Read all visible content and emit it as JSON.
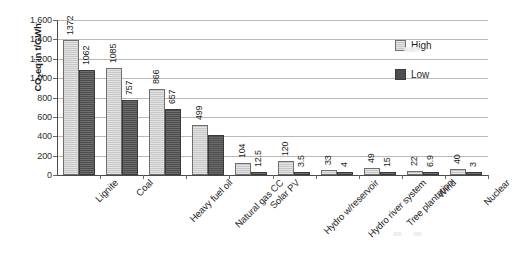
{
  "chart_data": {
    "type": "bar",
    "title": "",
    "xlabel": "",
    "ylabel": "CO2eq in t/GWh",
    "ylabel_parts": {
      "pre": "CO",
      "sub": "2",
      "post": "eq in t/GWh"
    },
    "ylim": [
      0,
      1600
    ],
    "ytick_step": 200,
    "ytick_labels": [
      "1,600",
      "1,400",
      "1,200",
      "1,000",
      "800",
      "600",
      "400",
      "200",
      "0"
    ],
    "ytick_values": [
      1600,
      1400,
      1200,
      1000,
      800,
      600,
      400,
      200,
      0
    ],
    "grid": true,
    "legend_position": "inside-top-right",
    "categories": [
      "Lignite",
      "Coal",
      "Heavy fuel oil",
      "Natural gas CC",
      "Solar PV",
      "Hydro w/reservoir",
      "Hydro river system",
      "Tree plantation",
      "Wind",
      "Nuclear"
    ],
    "series": [
      {
        "name": "High",
        "color": "#c6c6c6",
        "values": [
          1372,
          1085,
          866,
          499,
          104,
          120,
          33,
          49,
          22,
          40
        ],
        "labels": [
          "1372",
          "1085",
          "866",
          "499",
          "104",
          "120",
          "33",
          "49",
          "22",
          "40"
        ]
      },
      {
        "name": "Low",
        "color": "#4d4d4d",
        "values": [
          1062,
          757,
          657,
          390,
          12.5,
          3.5,
          4,
          15,
          6.9,
          3
        ],
        "labels": [
          "1062",
          "757",
          "657",
          "",
          "12.5",
          "3.5",
          "4",
          "15",
          "6.9",
          "3"
        ]
      }
    ]
  },
  "legend": {
    "items": [
      {
        "label": "High",
        "swatch": "high"
      },
      {
        "label": "Low",
        "swatch": "low"
      }
    ]
  }
}
